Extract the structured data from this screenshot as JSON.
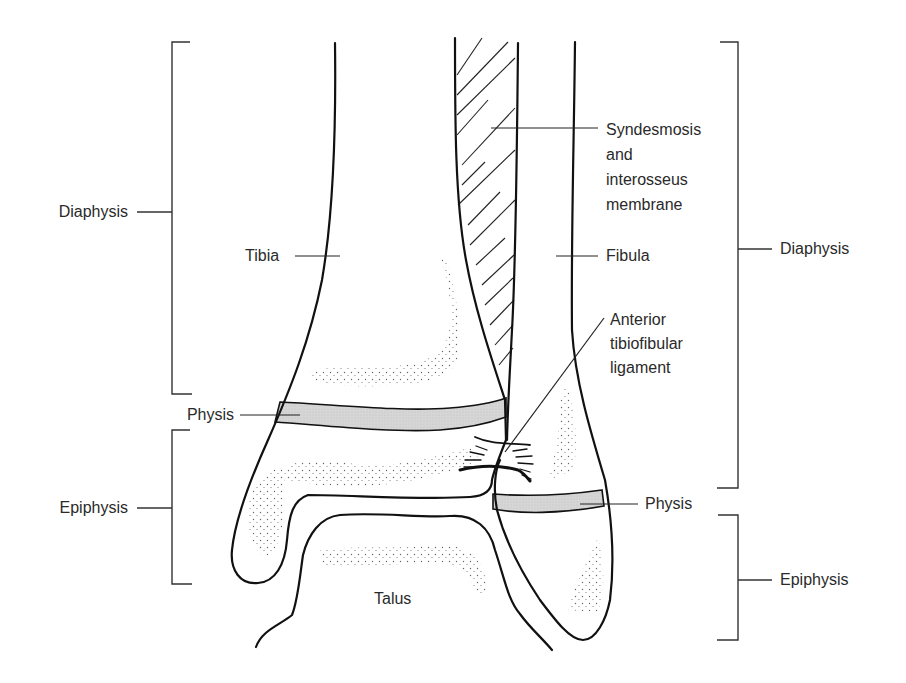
{
  "figure": {
    "colors": {
      "outline": "#111111",
      "bracket": "#333333",
      "physis_fill": "#d3d3d3",
      "stipple": "#555555",
      "text": "#2a2a2a",
      "background": "#ffffff"
    }
  },
  "labels": {
    "diaphysis_left": "Diaphysis",
    "physis_left": "Physis",
    "epiphysis_left": "Epiphysis",
    "tibia": "Tibia",
    "talus": "Talus",
    "fibula": "Fibula",
    "syndesmosis": [
      "Syndesmosis",
      "and",
      "interosseus",
      "membrane"
    ],
    "anterior_ligament": [
      "Anterior",
      "tibiofibular",
      "ligament"
    ],
    "diaphysis_right": "Diaphysis",
    "physis_right": "Physis",
    "epiphysis_right": "Epiphysis"
  },
  "brackets": [
    {
      "side": "left",
      "label": "Diaphysis",
      "x": 172,
      "y_top": 42,
      "y_bottom": 394,
      "tick_y": 212
    },
    {
      "side": "left",
      "label": "Epiphysis",
      "x": 172,
      "y_top": 430,
      "y_bottom": 584,
      "tick_y": 508
    },
    {
      "side": "right",
      "label": "Diaphysis",
      "x": 738,
      "y_top": 42,
      "y_bottom": 488,
      "tick_y": 249
    },
    {
      "side": "right",
      "label": "Epiphysis",
      "x": 738,
      "y_top": 515,
      "y_bottom": 640,
      "tick_y": 580
    }
  ]
}
